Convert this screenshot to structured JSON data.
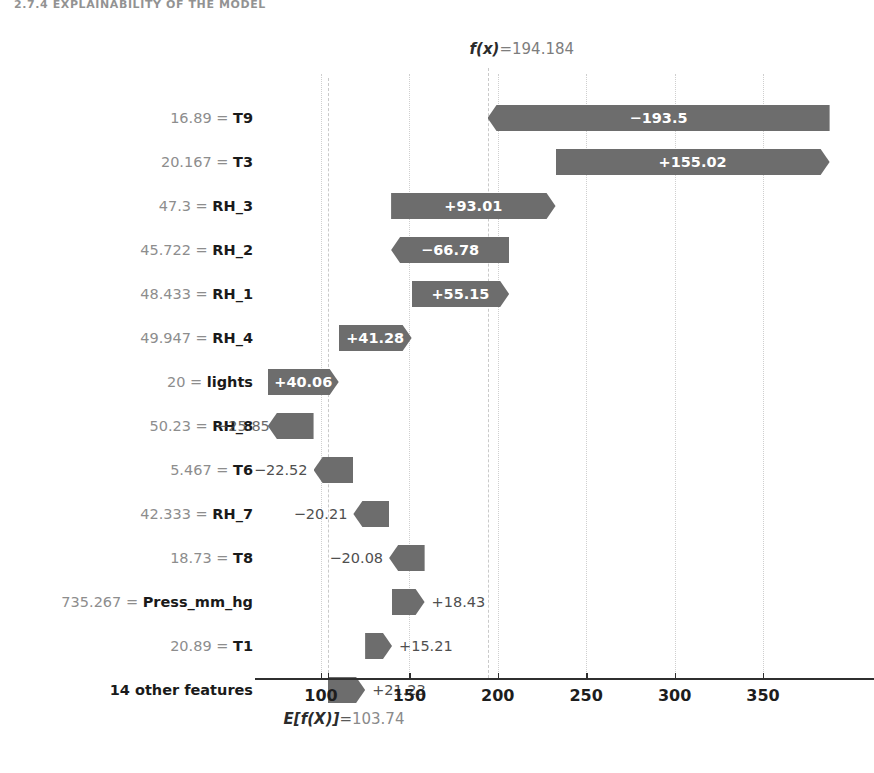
{
  "caption_fragment": "2.7.4  EXPLAINABILITY OF THE MODEL",
  "colors": {
    "bar": "#6d6d6d",
    "value_text_inside": "#ffffff",
    "value_text_outside": "#4f4f4f",
    "feature_value_text": "#8d8d8d",
    "feature_name_text": "#1a1a1a",
    "axis": "#2f2f2f",
    "gridline": "#c9c9c9"
  },
  "annotations": {
    "fx": {
      "math": "f(x)",
      "eq": "=",
      "value": "194.184"
    },
    "efx": {
      "math": "E[f(X)]",
      "eq": "=",
      "value": "103.74"
    }
  },
  "axis": {
    "tick_labels": [
      "100",
      "150",
      "200",
      "250",
      "300",
      "350"
    ],
    "tick_values": [
      100,
      150,
      200,
      250,
      300,
      350
    ],
    "xmin_visible": 82,
    "xmax_visible": 380
  },
  "chart_data": {
    "type": "bar",
    "subtype": "shap-waterfall",
    "title": "",
    "xlabel": "",
    "ylabel": "",
    "base_value": 103.74,
    "final_value": 194.184,
    "xlim": [
      82,
      380
    ],
    "grid": true,
    "legend": null,
    "orientation": "horizontal",
    "rows": [
      {
        "feature": "T9",
        "feature_value": "16.89",
        "label": "16.89 = T9",
        "value": -193.5,
        "value_label": "−193.5",
        "label_position": "inside",
        "clipped_right": true
      },
      {
        "feature": "T3",
        "feature_value": "20.167",
        "label": "20.167 = T3",
        "value": 155.02,
        "value_label": "+155.02",
        "label_position": "inside",
        "clipped_right": false
      },
      {
        "feature": "RH_3",
        "feature_value": "47.3",
        "label": "47.3 = RH_3",
        "value": 93.01,
        "value_label": "+93.01",
        "label_position": "inside",
        "clipped_right": false
      },
      {
        "feature": "RH_2",
        "feature_value": "45.722",
        "label": "45.722 = RH_2",
        "value": -66.78,
        "value_label": "−66.78",
        "label_position": "inside",
        "clipped_right": false
      },
      {
        "feature": "RH_1",
        "feature_value": "48.433",
        "label": "48.433 = RH_1",
        "value": 55.15,
        "value_label": "+55.15",
        "label_position": "inside",
        "clipped_right": false
      },
      {
        "feature": "RH_4",
        "feature_value": "49.947",
        "label": "49.947 = RH_4",
        "value": 41.28,
        "value_label": "+41.28",
        "label_position": "inside",
        "clipped_right": false
      },
      {
        "feature": "lights",
        "feature_value": "20",
        "label": "20 = lights",
        "value": 40.06,
        "value_label": "+40.06",
        "label_position": "inside",
        "clipped_right": false
      },
      {
        "feature": "RH_8",
        "feature_value": "50.23",
        "label": "50.23 = RH_8",
        "value": -25.85,
        "value_label": "−25.85",
        "label_position": "outside-left-overlap",
        "clipped_right": false
      },
      {
        "feature": "T6",
        "feature_value": "5.467",
        "label": "5.467 = T6",
        "value": -22.52,
        "value_label": "−22.52",
        "label_position": "outside-left",
        "clipped_right": false
      },
      {
        "feature": "RH_7",
        "feature_value": "42.333",
        "label": "42.333 = RH_7",
        "value": -20.21,
        "value_label": "−20.21",
        "label_position": "outside-left",
        "clipped_right": false
      },
      {
        "feature": "T8",
        "feature_value": "18.73",
        "label": "18.73 = T8",
        "value": -20.08,
        "value_label": "−20.08",
        "label_position": "outside-left",
        "clipped_right": false
      },
      {
        "feature": "Press_mm_hg",
        "feature_value": "735.267",
        "label": "735.267 = Press_mm_hg",
        "value": 18.43,
        "value_label": "+18.43",
        "label_position": "outside-right",
        "clipped_right": false
      },
      {
        "feature": "T1",
        "feature_value": "20.89",
        "label": "20.89 = T1",
        "value": 15.21,
        "value_label": "+15.21",
        "label_position": "outside-right",
        "clipped_right": false
      },
      {
        "feature": "14 other features",
        "feature_value": "",
        "label": "14 other features",
        "value": 21.23,
        "value_label": "+21.23",
        "label_position": "outside-right",
        "clipped_right": false,
        "is_other": true
      }
    ]
  }
}
